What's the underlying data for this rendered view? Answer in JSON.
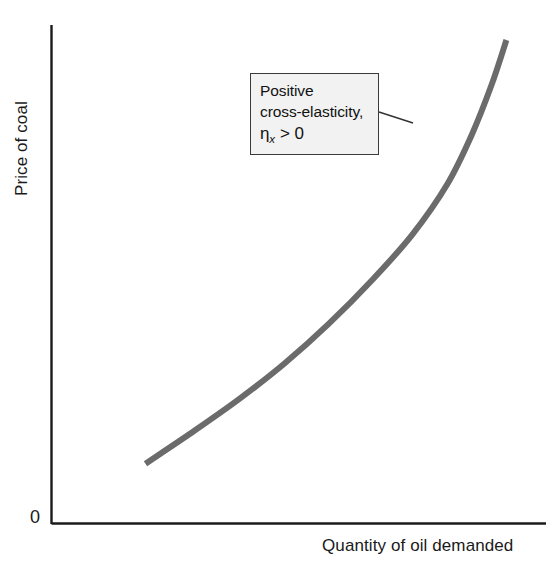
{
  "chart_data": {
    "type": "line",
    "title": "",
    "subtitle": "",
    "xlabel": "Quantity of oil demanded",
    "ylabel": "Price of coal",
    "origin_label": "0",
    "grid": false,
    "legend": null,
    "axis_ranges": {
      "x": [
        0,
        1
      ],
      "y": [
        0,
        1
      ]
    },
    "tick_labels": {
      "x": [],
      "y": []
    },
    "series": [
      {
        "name": "Demand for oil vs price of coal",
        "description": "Upward sloping convex curve showing positive cross-elasticity between the price of coal and the quantity of oil demanded",
        "color": "#6b6b6b",
        "line_width_px": 6,
        "x": [
          0.19,
          0.28,
          0.38,
          0.47,
          0.56,
          0.65,
          0.73,
          0.8,
          0.85,
          0.89,
          0.92
        ],
        "y": [
          0.12,
          0.18,
          0.25,
          0.32,
          0.4,
          0.49,
          0.58,
          0.68,
          0.78,
          0.88,
          0.97
        ]
      }
    ],
    "annotations": [
      {
        "id": "cross-elasticity-callout",
        "lines": [
          "Positive",
          "cross-elasticity,"
        ],
        "equation": {
          "symbol": "η",
          "subscript": "x",
          "relation": "> 0",
          "text": "ηx > 0"
        },
        "box_fill": "#f2f2f2",
        "box_border": "#3a3a3a",
        "leader_line": {
          "from": [
            379,
            112
          ],
          "to": [
            413,
            123
          ],
          "color": "#333333"
        }
      }
    ],
    "axis_color": "#1a1a1a",
    "background": "#ffffff"
  }
}
